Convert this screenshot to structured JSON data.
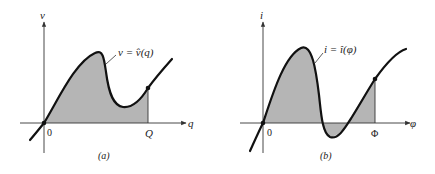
{
  "figure": {
    "background": "#ffffff",
    "curve_color": "#111111",
    "shade_color": "#b5b5b5",
    "axis_color": "#333333",
    "panels": [
      {
        "id": "a",
        "caption": "(a)",
        "y_axis_label": "v",
        "x_axis_label": "q",
        "origin_label": "0",
        "end_label": "Q",
        "curve_label": "v = v̂(q)"
      },
      {
        "id": "b",
        "caption": "(b)",
        "y_axis_label": "i",
        "x_axis_label": "φ",
        "origin_label": "0",
        "end_label": "Φ",
        "curve_label": "i = î(φ)"
      }
    ]
  }
}
